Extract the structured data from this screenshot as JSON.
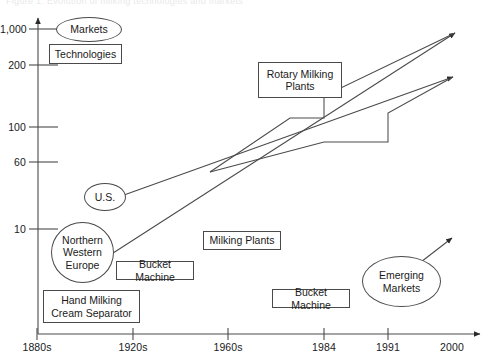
{
  "figure": {
    "faint_header": "Figure 1. Evolution of milking technologies and markets",
    "background": "#ffffff",
    "line_color": "#4a4a4a",
    "text_color": "#1a1a1a"
  },
  "chart_data": {
    "type": "line",
    "title": "",
    "subtitle": "",
    "xlabel": "",
    "ylabel": "",
    "grid": false,
    "legend": null,
    "x_axis": {
      "tick_labels": [
        "1880s",
        "1920s",
        "1960s",
        "1984",
        "1991",
        "2000"
      ],
      "tick_px": [
        37,
        133,
        228,
        324,
        388,
        452
      ],
      "arrow_end": true
    },
    "y_axis": {
      "tick_labels": [
        "1,000",
        "200",
        "100",
        "60",
        "10"
      ],
      "tick_values": [
        1000,
        200,
        100,
        60,
        10
      ],
      "tick_px": [
        29,
        65,
        127,
        162,
        229
      ],
      "scale": "log-like (non-uniform)",
      "arrow_end": true
    },
    "series": [
      {
        "name": "Northern Western Europe trajectory",
        "style": "solid-line-with-arrow",
        "points_px": [
          [
            96,
            264
          ],
          [
            210,
            172
          ],
          [
            455,
            33
          ]
        ],
        "annotation_start": "Northern Western Europe",
        "annotation_end": "arrow to 2000"
      },
      {
        "name": "U.S. trajectory",
        "style": "solid-line-with-arrow",
        "points_px": [
          [
            124,
            195
          ],
          [
            210,
            172
          ],
          [
            453,
            77
          ]
        ],
        "annotation_start": "U.S.",
        "annotation_end": "arrow to 2000"
      },
      {
        "name": "Rotary milking plants step (upper)",
        "style": "step",
        "points_px": [
          [
            210,
            172
          ],
          [
            290,
            118
          ],
          [
            324,
            118
          ],
          [
            324,
            96
          ],
          [
            455,
            33
          ]
        ],
        "annotation": "Rotary Milking Plants"
      },
      {
        "name": "Herd-size step (lower)",
        "style": "step",
        "points_px": [
          [
            210,
            172
          ],
          [
            324,
            142
          ],
          [
            324,
            142
          ],
          [
            388,
            142
          ],
          [
            388,
            113
          ],
          [
            453,
            77
          ]
        ],
        "annotation": "Bucket Machine / Milking Plants"
      },
      {
        "name": "Emerging markets trajectory",
        "style": "solid-line-with-arrow",
        "points_px": [
          [
            408,
            272
          ],
          [
            452,
            238
          ]
        ],
        "annotation_start": "Emerging Markets"
      }
    ],
    "annotations": [
      {
        "id": "markets",
        "label": "Markets",
        "shape": "ellipse",
        "x": 56,
        "y": 17,
        "w": 66,
        "h": 25
      },
      {
        "id": "technologies",
        "label": "Technologies",
        "shape": "box",
        "x": 49,
        "y": 44,
        "w": 73,
        "h": 20
      },
      {
        "id": "rotary",
        "label": "Rotary Milking\nPlants",
        "shape": "box",
        "x": 258,
        "y": 62,
        "w": 84,
        "h": 36
      },
      {
        "id": "us",
        "label": "U.S.",
        "shape": "ellipse",
        "x": 84,
        "y": 183,
        "w": 42,
        "h": 28
      },
      {
        "id": "nwe",
        "label": "Northern\nWestern\nEurope",
        "shape": "ellipse",
        "x": 51,
        "y": 222,
        "w": 63,
        "h": 61
      },
      {
        "id": "milking-plants",
        "label": "Milking Plants",
        "shape": "box",
        "x": 203,
        "y": 231,
        "w": 78,
        "h": 19
      },
      {
        "id": "bucket-left",
        "label": "Bucket Machine",
        "shape": "box",
        "x": 116,
        "y": 261,
        "w": 78,
        "h": 19
      },
      {
        "id": "bucket-right",
        "label": "Bucket Machine",
        "shape": "box",
        "x": 272,
        "y": 289,
        "w": 78,
        "h": 19
      },
      {
        "id": "emerging",
        "label": "Emerging\nMarkets",
        "shape": "ellipse",
        "x": 362,
        "y": 256,
        "w": 79,
        "h": 51
      },
      {
        "id": "hand-milking",
        "label": "Hand Milking\nCream Separator",
        "shape": "box",
        "x": 43,
        "y": 290,
        "w": 97,
        "h": 33
      }
    ]
  }
}
